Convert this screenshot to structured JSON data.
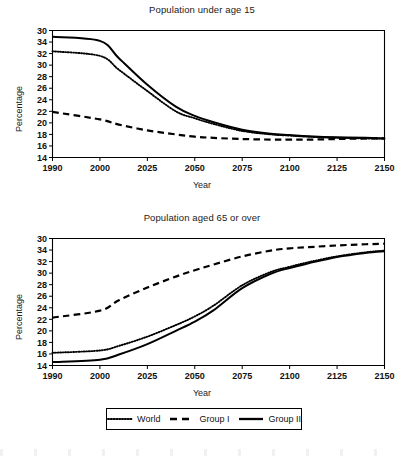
{
  "figure": {
    "background_color": "#ffffff",
    "ink_color": "#000000"
  },
  "axis_titles": {
    "y": "Percentage",
    "x": "Year"
  },
  "legend": {
    "position": "below-bottom-panel",
    "entries": [
      {
        "label": "World",
        "style": "dotted"
      },
      {
        "label": "Group I",
        "style": "dashed"
      },
      {
        "label": "Group II",
        "style": "solid"
      }
    ]
  },
  "chart_data": [
    {
      "type": "line",
      "title": "Population under age 15",
      "xlabel": "Year",
      "ylabel": "Percentage",
      "xlim": [
        1990,
        2150
      ],
      "ylim": [
        14,
        36
      ],
      "grid": false,
      "legend_position": "below",
      "xticks": [
        1990,
        2000,
        2025,
        2050,
        2075,
        2100,
        2125,
        2150
      ],
      "xtick_labels": [
        "1990",
        "2000",
        "2025",
        "2050",
        "2075",
        "2100",
        "2125",
        "2150"
      ],
      "yticks": [
        14,
        16,
        18,
        20,
        22,
        24,
        26,
        28,
        30,
        32,
        34,
        36
      ],
      "ytick_labels": [
        "14",
        "16",
        "18",
        "20",
        "22",
        "24",
        "26",
        "28",
        "30",
        "32",
        "34",
        "30"
      ],
      "x": [
        1990,
        2000,
        2010,
        2025,
        2040,
        2050,
        2060,
        2075,
        2090,
        2100,
        2110,
        2125,
        2140,
        2150
      ],
      "series": [
        {
          "name": "World",
          "style": "dotted",
          "values": [
            32.4,
            31.6,
            29.2,
            25.5,
            22.0,
            20.8,
            19.8,
            18.6,
            18.0,
            17.8,
            17.6,
            17.4,
            17.3,
            17.3
          ]
        },
        {
          "name": "Group I",
          "style": "dashed",
          "values": [
            21.9,
            20.6,
            19.7,
            18.7,
            18.0,
            17.6,
            17.4,
            17.2,
            17.1,
            17.1,
            17.1,
            17.2,
            17.3,
            17.3
          ]
        },
        {
          "name": "Group II",
          "style": "solid",
          "values": [
            34.9,
            34.2,
            31.2,
            26.6,
            22.8,
            21.2,
            20.1,
            18.8,
            18.1,
            17.9,
            17.7,
            17.5,
            17.4,
            17.3
          ]
        }
      ]
    },
    {
      "type": "line",
      "title": "Population aged 65 or over",
      "xlabel": "Year",
      "ylabel": "Percentage",
      "xlim": [
        1990,
        2150
      ],
      "ylim": [
        14,
        36
      ],
      "grid": false,
      "legend_position": "below",
      "xticks": [
        1990,
        2000,
        2025,
        2050,
        2075,
        2100,
        2125,
        2150
      ],
      "xtick_labels": [
        "1990",
        "2000",
        "2025",
        "2050",
        "2075",
        "2100",
        "2125",
        "2150"
      ],
      "yticks": [
        14,
        16,
        18,
        20,
        22,
        24,
        26,
        28,
        30,
        32,
        34,
        36
      ],
      "ytick_labels": [
        "14",
        "16",
        "18",
        "20",
        "22",
        "24",
        "26",
        "28",
        "30",
        "32",
        "34",
        "30"
      ],
      "x": [
        1990,
        2000,
        2010,
        2025,
        2040,
        2050,
        2060,
        2075,
        2090,
        2100,
        2110,
        2125,
        2140,
        2150
      ],
      "series": [
        {
          "name": "World",
          "style": "dotted",
          "values": [
            16.2,
            16.6,
            17.4,
            19.0,
            21.0,
            22.5,
            24.4,
            27.9,
            30.2,
            31.1,
            31.9,
            32.9,
            33.6,
            33.9
          ]
        },
        {
          "name": "Group I",
          "style": "dashed",
          "values": [
            22.3,
            23.5,
            25.3,
            27.5,
            29.4,
            30.5,
            31.5,
            32.9,
            33.9,
            34.3,
            34.5,
            34.8,
            35.0,
            35.1
          ]
        },
        {
          "name": "Group II",
          "style": "solid",
          "values": [
            14.6,
            15.0,
            15.9,
            17.7,
            20.0,
            21.6,
            23.6,
            27.4,
            29.9,
            30.9,
            31.7,
            32.8,
            33.5,
            33.8
          ]
        }
      ]
    }
  ]
}
